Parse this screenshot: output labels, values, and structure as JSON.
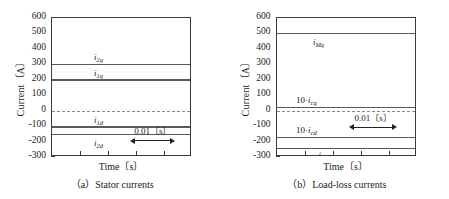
{
  "figure": {
    "panels": [
      {
        "id": "stator",
        "caption": "（a）Stator currents",
        "axis": {
          "ylabel": "Current〔A〕",
          "xlabel": "Time〔s〕",
          "yticks": [
            "600",
            "500",
            "400",
            "300",
            "200",
            "100",
            "0",
            "-100",
            "-200",
            "-300"
          ],
          "ylim": [
            -300,
            600
          ]
        },
        "annotation": {
          "text": "0.01〔s〕"
        },
        "series": [
          {
            "name": "i2q",
            "label_main": "i",
            "label_sub": "2q",
            "prefix": "",
            "value": 300
          },
          {
            "name": "i1q",
            "label_main": "i",
            "label_sub": "1q",
            "prefix": "",
            "value": 200
          },
          {
            "name": "i1d",
            "label_main": "i",
            "label_sub": "1d",
            "prefix": "",
            "value": -105
          },
          {
            "name": "i2d",
            "label_main": "i",
            "label_sub": "2d",
            "prefix": "",
            "value": -155
          }
        ],
        "zero_line": 0
      },
      {
        "id": "load-loss",
        "caption": "（b）Load-loss currents",
        "axis": {
          "ylabel": "Current〔A〕",
          "xlabel": "Time〔s〕",
          "yticks": [
            "600",
            "500",
            "400",
            "300",
            "200",
            "100",
            "0",
            "-100",
            "-200",
            "-300"
          ],
          "ylim": [
            -300,
            600
          ]
        },
        "annotation": {
          "text": "0.01〔s〕"
        },
        "series": [
          {
            "name": "iMq",
            "label_main": "i",
            "label_sub": "Mq",
            "prefix": "",
            "value": 500
          },
          {
            "name": "10icq",
            "label_main": "i",
            "label_sub": "cq",
            "prefix": "10·",
            "value": 20
          },
          {
            "name": "10icd",
            "label_main": "i",
            "label_sub": "cd",
            "prefix": "10·",
            "value": -175
          },
          {
            "name": "iMd",
            "label_main": "i",
            "label_sub": "Md",
            "prefix": "",
            "value": -245
          }
        ],
        "zero_line": 0
      }
    ]
  },
  "chart_data": [
    {
      "type": "line",
      "title": "（a）Stator currents",
      "xlabel": "Time〔s〕",
      "ylabel": "Current〔A〕",
      "ylim": [
        -300,
        600
      ],
      "yticks": [
        600,
        500,
        400,
        300,
        200,
        100,
        0,
        -100,
        -200,
        -300
      ],
      "xticks_labeled": false,
      "grid": false,
      "legend": "inline-annotations",
      "annotations": [
        {
          "text": "0.01〔s〕",
          "kind": "double-arrow-span",
          "axis": "x"
        }
      ],
      "series": [
        {
          "name": "i_2q",
          "values": [
            300,
            300
          ],
          "style": "solid",
          "constant": 300
        },
        {
          "name": "i_1q",
          "values": [
            200,
            200
          ],
          "style": "solid",
          "constant": 200
        },
        {
          "name": "i_1d",
          "values": [
            -105,
            -105
          ],
          "style": "solid",
          "constant": -105
        },
        {
          "name": "i_2d",
          "values": [
            -155,
            -155
          ],
          "style": "solid",
          "constant": -155
        },
        {
          "name": "zero",
          "values": [
            0,
            0
          ],
          "style": "dashed",
          "constant": 0
        }
      ]
    },
    {
      "type": "line",
      "title": "（b）Load-loss currents",
      "xlabel": "Time〔s〕",
      "ylabel": "Current〔A〕",
      "ylim": [
        -300,
        600
      ],
      "yticks": [
        600,
        500,
        400,
        300,
        200,
        100,
        0,
        -100,
        -200,
        -300
      ],
      "xticks_labeled": false,
      "grid": false,
      "legend": "inline-annotations",
      "annotations": [
        {
          "text": "0.01〔s〕",
          "kind": "double-arrow-span",
          "axis": "x"
        }
      ],
      "series": [
        {
          "name": "i_Mq",
          "values": [
            500,
            500
          ],
          "style": "solid",
          "constant": 500
        },
        {
          "name": "10·i_cq",
          "values": [
            20,
            20
          ],
          "style": "solid",
          "constant": 20
        },
        {
          "name": "10·i_cd",
          "values": [
            -175,
            -175
          ],
          "style": "solid",
          "constant": -175
        },
        {
          "name": "i_Md",
          "values": [
            -245,
            -245
          ],
          "style": "solid",
          "constant": -245
        },
        {
          "name": "zero",
          "values": [
            0,
            0
          ],
          "style": "dashed",
          "constant": 0
        }
      ]
    }
  ]
}
